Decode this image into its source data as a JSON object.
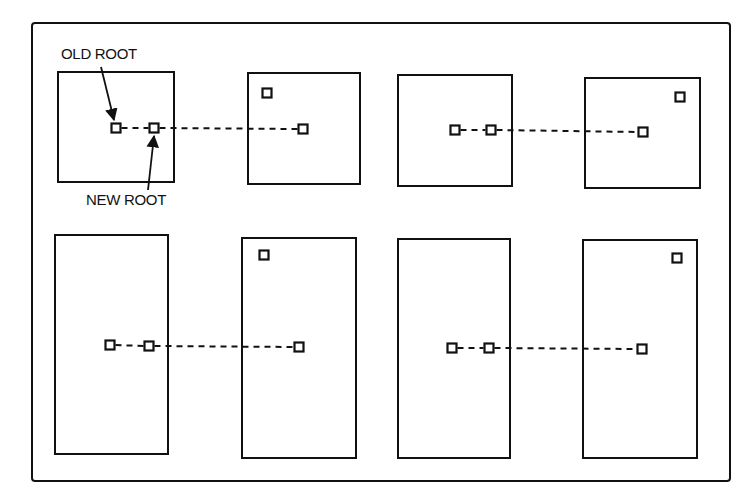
{
  "diagram": {
    "title": "",
    "labels": {
      "old_root": "OLD ROOT",
      "new_root": "NEW ROOT"
    },
    "colors": {
      "stroke": "#111111",
      "background": "#ffffff"
    },
    "frame": {
      "x": 32,
      "y": 23,
      "w": 698,
      "h": 458
    },
    "rows": [
      {
        "name": "row-1",
        "pages": [
          {
            "x": 58,
            "y": 72,
            "w": 116,
            "h": 110
          },
          {
            "x": 248,
            "y": 73,
            "w": 112,
            "h": 111
          },
          {
            "x": 398,
            "y": 75,
            "w": 114,
            "h": 111
          },
          {
            "x": 585,
            "y": 78,
            "w": 115,
            "h": 110
          }
        ],
        "nodes": [
          {
            "id": "old-root-1",
            "x": 116,
            "y": 128
          },
          {
            "id": "new-root-1",
            "x": 154,
            "y": 128
          },
          {
            "id": "target-1",
            "x": 303,
            "y": 129
          },
          {
            "id": "corner-1",
            "x": 267,
            "y": 93
          },
          {
            "id": "old-root-2",
            "x": 455,
            "y": 130
          },
          {
            "id": "new-root-2",
            "x": 491,
            "y": 130
          },
          {
            "id": "target-2",
            "x": 643,
            "y": 132
          },
          {
            "id": "corner-2",
            "x": 680,
            "y": 97
          }
        ],
        "links": [
          {
            "from": "old-root-1",
            "to": "new-root-1"
          },
          {
            "from": "new-root-1",
            "to": "target-1"
          },
          {
            "from": "old-root-2",
            "to": "new-root-2"
          },
          {
            "from": "new-root-2",
            "to": "target-2"
          }
        ]
      },
      {
        "name": "row-2",
        "pages": [
          {
            "x": 55,
            "y": 235,
            "w": 113,
            "h": 219
          },
          {
            "x": 242,
            "y": 238,
            "w": 114,
            "h": 220
          },
          {
            "x": 398,
            "y": 239,
            "w": 112,
            "h": 219
          },
          {
            "x": 583,
            "y": 240,
            "w": 114,
            "h": 218
          }
        ],
        "nodes": [
          {
            "id": "old-root-3",
            "x": 110,
            "y": 345
          },
          {
            "id": "new-root-3",
            "x": 149,
            "y": 346
          },
          {
            "id": "target-3",
            "x": 299,
            "y": 347
          },
          {
            "id": "corner-3",
            "x": 264,
            "y": 255
          },
          {
            "id": "old-root-4",
            "x": 452,
            "y": 348
          },
          {
            "id": "new-root-4",
            "x": 489,
            "y": 348
          },
          {
            "id": "target-4",
            "x": 642,
            "y": 349
          },
          {
            "id": "corner-4",
            "x": 677,
            "y": 258
          }
        ],
        "links": [
          {
            "from": "old-root-3",
            "to": "new-root-3"
          },
          {
            "from": "new-root-3",
            "to": "target-3"
          },
          {
            "from": "old-root-4",
            "to": "new-root-4"
          },
          {
            "from": "new-root-4",
            "to": "target-4"
          }
        ]
      }
    ]
  }
}
